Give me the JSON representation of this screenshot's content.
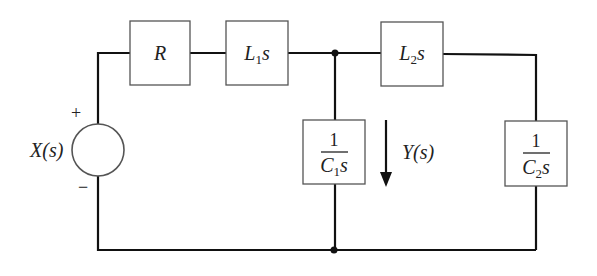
{
  "diagram": {
    "type": "circuit",
    "source": {
      "label": "X(s)",
      "plus": "+",
      "minus": "−"
    },
    "components": {
      "R": {
        "label": "R"
      },
      "L1": {
        "main": "L",
        "sub": "1",
        "tail": "s"
      },
      "L2": {
        "main": "L",
        "sub": "2",
        "tail": "s"
      },
      "C1": {
        "numerator": "1",
        "main": "C",
        "sub": "1",
        "tail": "s"
      },
      "C2": {
        "numerator": "1",
        "main": "C",
        "sub": "2",
        "tail": "s"
      }
    },
    "output": {
      "label": "Y(s)",
      "direction": "down"
    },
    "colors": {
      "wire": "#111111",
      "box": "#444444",
      "text": "#222222"
    }
  }
}
